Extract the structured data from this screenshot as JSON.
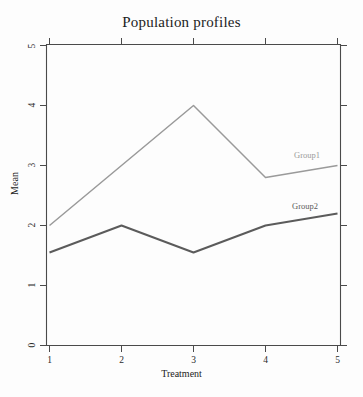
{
  "chart_data": {
    "type": "line",
    "title": "Population profiles",
    "xlabel": "Treatment",
    "ylabel": "Mean",
    "x": [
      1,
      2,
      3,
      4,
      5
    ],
    "categories": [
      "1",
      "2",
      "3",
      "4",
      "5"
    ],
    "xticks": [
      "1",
      "2",
      "3",
      "4",
      "5"
    ],
    "yticks": [
      "0",
      "1",
      "2",
      "3",
      "4",
      "5"
    ],
    "xlim": [
      1,
      5
    ],
    "ylim": [
      0,
      5
    ],
    "grid": false,
    "legend_position": "inline-right",
    "series": [
      {
        "name": "Group1",
        "values": [
          2.0,
          3.0,
          4.0,
          2.8,
          3.0
        ],
        "color": "#9a9a9a",
        "label_text": "Group1"
      },
      {
        "name": "Group2",
        "values": [
          1.55,
          2.0,
          1.55,
          2.0,
          2.2
        ],
        "color": "#5b5b5b",
        "label_text": "Group2"
      }
    ]
  },
  "axes": {
    "title": "Population profiles",
    "x_title": "Treatment",
    "y_title": "Mean"
  },
  "ticks": {
    "x": [
      {
        "label": "1"
      },
      {
        "label": "2"
      },
      {
        "label": "3"
      },
      {
        "label": "4"
      },
      {
        "label": "5"
      }
    ],
    "y": [
      {
        "label": "0"
      },
      {
        "label": "1"
      },
      {
        "label": "2"
      },
      {
        "label": "3"
      },
      {
        "label": "4"
      },
      {
        "label": "5"
      }
    ]
  },
  "labels": {
    "group1": "Group1",
    "group2": "Group2"
  },
  "colors": {
    "group1": "#9a9a9a",
    "group2": "#5b5b5b",
    "axis": "#4a4a4a",
    "background": "#fdfdfd",
    "text": "#1c1c1c"
  }
}
